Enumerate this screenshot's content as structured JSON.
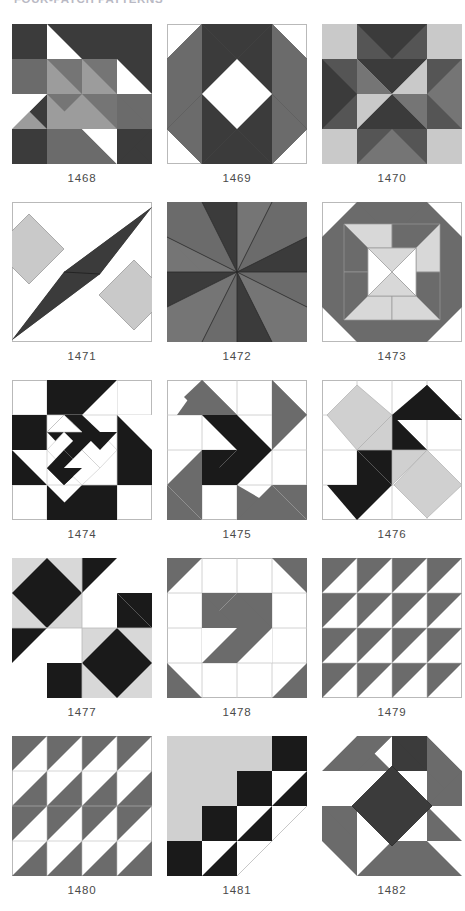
{
  "header": {
    "title": "FOUR-PATCH PATTERNS"
  },
  "palette": {
    "white": "#ffffff",
    "light_grey": "#c9c9c9",
    "mid_grey": "#757575",
    "dark_grey": "#6b6b6b",
    "charcoal": "#3b3b3b",
    "black": "#1a1a1a",
    "outline": "#b9b9b9"
  },
  "blocks": [
    {
      "id": "1468",
      "caption": "1468",
      "name": "pinwheel-with-flying-geese",
      "description": "Four-quadrant pinwheel; each quadrant has a dark background, a mid-grey pinwheel blade and a white triangle"
    },
    {
      "id": "1469",
      "caption": "1469",
      "name": "square-in-a-square-octagon",
      "description": "Octagon of mid-grey and dark triangles surrounding a white on-point square"
    },
    {
      "id": "1470",
      "caption": "1470",
      "name": "pinwheel-in-nine-patch",
      "description": "Central eight-point pinwheel of light and dark grey set in a grey nine-patch frame"
    },
    {
      "id": "1471",
      "caption": "1471",
      "name": "diagonal-bowtie-star",
      "description": "Two light-grey on-point squares crossed by a long dark diagonal lens shape"
    },
    {
      "id": "1472",
      "caption": "1472",
      "name": "four-quadrant-dark-pinwheel",
      "description": "Four quadrants, each a pinwheel of dark and medium grey triangles"
    },
    {
      "id": "1473",
      "caption": "1473",
      "name": "octagon-with-light-pinwheel",
      "description": "Dark grey octagon frame enclosing a light grey and white pinwheel centre"
    },
    {
      "id": "1474",
      "caption": "1474",
      "name": "black-and-white-chained-star",
      "description": "Black-on-white chain of triangles and squares forming an on-point star"
    },
    {
      "id": "1475",
      "caption": "1475",
      "name": "double-pinwheel-grey-black",
      "description": "Large grey pinwheel blades with an inner black pinwheel on white"
    },
    {
      "id": "1476",
      "caption": "1476",
      "name": "diagonal-zigzag-pinwheel",
      "description": "Diagonal arrangement of black and light grey triangles on white"
    },
    {
      "id": "1477",
      "caption": "1477",
      "name": "four-patch-square-in-square",
      "description": "Four quadrants alternating black on-point squares and black/white diagonals"
    },
    {
      "id": "1478",
      "caption": "1478",
      "name": "pinwheel-with-corner-triangles",
      "description": "Central grey pinwheel with grey triangles in the four corner squares"
    },
    {
      "id": "1479",
      "caption": "1479",
      "name": "half-square-triangle-grid",
      "description": "Four by four grid of identical grey half-square triangles"
    },
    {
      "id": "1480",
      "caption": "1480",
      "name": "alternating-triangle-grid",
      "description": "Four by four grid of grey half-square triangles alternating orientation by row"
    },
    {
      "id": "1481",
      "caption": "1481",
      "name": "streak-of-lightning",
      "description": "Large light grey triangle with a stepped black and white staircase along the diagonal"
    },
    {
      "id": "1482",
      "caption": "1482",
      "name": "dark-diamond-with-pinwheel-border",
      "description": "Dark on-point diamond centre surrounded by grey parallelogram blades"
    }
  ]
}
